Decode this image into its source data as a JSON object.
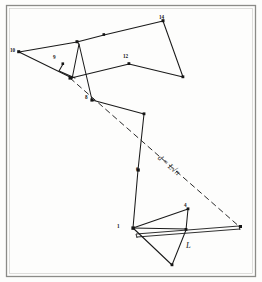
{
  "figure": {
    "background_color": "#fdfdfc",
    "ink_color": "#1a1a1a",
    "frame_color": "#8b8b88",
    "formula": "d = L√n",
    "formula_parts": {
      "variable": "d",
      "equals": "=",
      "expression": "L√n"
    },
    "step_length_label": "L",
    "vertex_labels": [
      {
        "id": "v1",
        "text": "1",
        "x": 118,
        "y": 233
      },
      {
        "id": "v4",
        "text": "4",
        "x": 182,
        "y": 207
      },
      {
        "id": "v6",
        "text": "6",
        "x": 137,
        "y": 172
      },
      {
        "id": "v8",
        "text": "8",
        "x": 86,
        "y": 100
      },
      {
        "id": "v9",
        "text": "9",
        "x": 54,
        "y": 58
      },
      {
        "id": "v10",
        "text": "10",
        "x": 11,
        "y": 52
      },
      {
        "id": "v12",
        "text": "12",
        "x": 124,
        "y": 57
      },
      {
        "id": "v14",
        "text": "14",
        "x": 158,
        "y": 18
      }
    ],
    "walk_vertices": [
      {
        "n": 1,
        "x": 131,
        "y": 229
      },
      {
        "n": 2,
        "x": 172,
        "y": 265
      },
      {
        "n": 3,
        "x": 186,
        "y": 229
      },
      {
        "n": 4,
        "x": 188,
        "y": 209
      },
      {
        "n": 5,
        "x": 133,
        "y": 228
      },
      {
        "n": 6,
        "x": 138,
        "y": 170
      },
      {
        "n": 7,
        "x": 144,
        "y": 114
      },
      {
        "n": 8,
        "x": 92,
        "y": 100
      },
      {
        "n": 9,
        "x": 70,
        "y": 76
      },
      {
        "n": 10,
        "x": 19,
        "y": 52
      },
      {
        "n": 11,
        "x": 77,
        "y": 42
      },
      {
        "n": 12,
        "x": 129,
        "y": 64
      },
      {
        "n": 13,
        "x": 183,
        "y": 77
      },
      {
        "n": 14,
        "x": 163,
        "y": 21
      },
      {
        "n": 15,
        "x": 104,
        "y": 35
      },
      {
        "n": 16,
        "x": 71,
        "y": 78
      }
    ],
    "displacement": {
      "start_x": 70,
      "start_y": 78,
      "end_x": 241,
      "end_y": 228,
      "label": "d = L√n"
    },
    "scale_bar": {
      "from_x": 135,
      "from_y": 233,
      "to_x": 239,
      "to_y": 226,
      "label": "L"
    }
  }
}
